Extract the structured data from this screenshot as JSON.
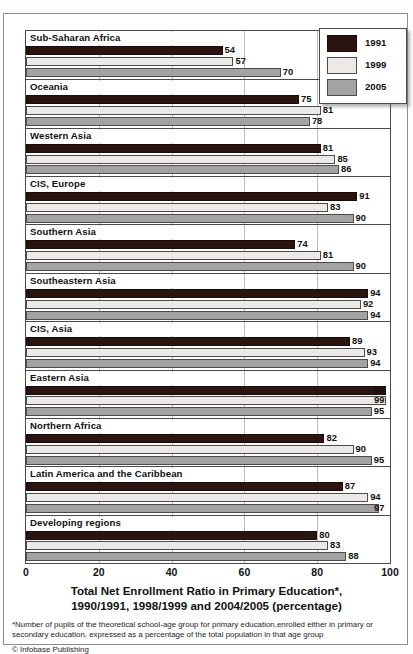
{
  "chart_data": {
    "type": "bar",
    "orientation": "horizontal",
    "title": "Total Net Enrollment Ratio in Primary Education*,",
    "subtitle": "1990/1991, 1998/1999 and 2004/2005 (percentage)",
    "xlabel": "",
    "ylabel": "",
    "xlim": [
      0,
      100
    ],
    "xticks": [
      0,
      20,
      40,
      60,
      80,
      100
    ],
    "grid": true,
    "legend_position": "top-right",
    "categories": [
      "Sub-Saharan Africa",
      "Oceania",
      "Western Asia",
      "CIS, Europe",
      "Southern Asia",
      "Southeastern Asia",
      "CIS, Asia",
      "Eastern Asia",
      "Northern Africa",
      "Latin America and the Caribbean",
      "Developing regions"
    ],
    "series": [
      {
        "name": "1991",
        "color": "#2a1410",
        "values": [
          54,
          75,
          81,
          91,
          74,
          94,
          89,
          99,
          82,
          87,
          80
        ]
      },
      {
        "name": "1999",
        "color": "#eceae6",
        "values": [
          57,
          81,
          85,
          83,
          81,
          92,
          93,
          99,
          90,
          94,
          83
        ]
      },
      {
        "name": "2005",
        "color": "#a3a3a3",
        "values": [
          70,
          78,
          86,
          90,
          90,
          94,
          94,
          95,
          95,
          97,
          88
        ]
      }
    ]
  },
  "legend": {
    "items": [
      {
        "label": "1991"
      },
      {
        "label": "1999"
      },
      {
        "label": "2005"
      }
    ]
  },
  "footer": {
    "footnote": "*Number of pupils of the theoretical school-age group for primary education,enrolled either in primary or secondary education, expressed as a percentage of the total population in that age group",
    "copyright": "© Infobase Publishing"
  }
}
